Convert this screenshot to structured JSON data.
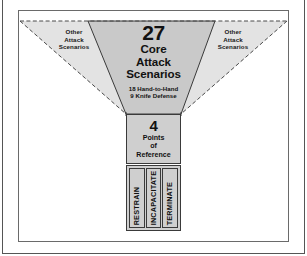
{
  "diagram": {
    "type": "funnel",
    "side_labels": {
      "left": [
        "Other",
        "Attack",
        "Scenarios"
      ],
      "right": [
        "Other",
        "Attack",
        "Scenarios"
      ]
    },
    "core": {
      "number": "27",
      "title_lines": [
        "Core",
        "Attack",
        "Scenarios"
      ],
      "breakdown": [
        "18 Hand-to-Hand",
        "9 Knife Defense"
      ]
    },
    "reference": {
      "number": "4",
      "title_lines": [
        "Points",
        "of",
        "Reference"
      ]
    },
    "outcomes": [
      {
        "label": "RESTRAIN"
      },
      {
        "label": "INCAPACITATE"
      },
      {
        "label": "TERMINATE"
      }
    ],
    "colors": {
      "outer_funnel_fill": "#e3e3e3",
      "inner_funnel_fill": "#c9c9c9",
      "box_fill": "#cfcfcf",
      "stroke": "#3a3a3a",
      "dashed_stroke": "#4a4a4a",
      "text": "#111111",
      "frame": "#6a6a6a",
      "page_background": "#ffffff"
    }
  }
}
